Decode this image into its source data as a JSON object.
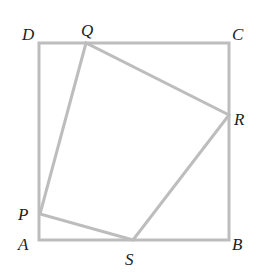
{
  "figure": {
    "stroke_color": "#bdbdbd",
    "label_color": "#222222",
    "square": {
      "vertices": {
        "A": [
          39,
          240
        ],
        "B": [
          229,
          240
        ],
        "C": [
          229,
          43
        ],
        "D": [
          39,
          43
        ]
      }
    },
    "inner_quadrilateral": {
      "vertices": {
        "P": [
          40,
          214
        ],
        "Q": [
          86,
          43
        ],
        "R": [
          229,
          115
        ],
        "S": [
          133,
          240
        ]
      }
    },
    "labels": [
      {
        "id": "D",
        "text": "D",
        "x": 22,
        "y": 40
      },
      {
        "id": "Q",
        "text": "Q",
        "x": 81,
        "y": 36
      },
      {
        "id": "C",
        "text": "C",
        "x": 232,
        "y": 40
      },
      {
        "id": "R",
        "text": "R",
        "x": 234,
        "y": 125
      },
      {
        "id": "P",
        "text": "P",
        "x": 18,
        "y": 220
      },
      {
        "id": "A",
        "text": "A",
        "x": 18,
        "y": 250
      },
      {
        "id": "S",
        "text": "S",
        "x": 125,
        "y": 265
      },
      {
        "id": "B",
        "text": "B",
        "x": 232,
        "y": 250
      }
    ]
  }
}
